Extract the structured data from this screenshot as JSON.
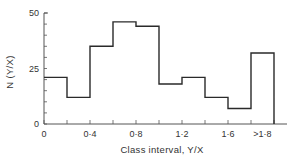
{
  "chart_data": {
    "type": "bar",
    "subtype": "histogram-step",
    "title": "",
    "xlabel": "Class interval, Y/X",
    "ylabel": "N (Y/X)",
    "bin_edges": [
      0,
      0.2,
      0.4,
      0.6,
      0.8,
      1.0,
      1.2,
      1.4,
      1.6,
      1.8,
      2.0
    ],
    "categories": [
      "0-0.2",
      "0.2-0.4",
      "0.4-0.6",
      "0.6-0.8",
      "0.8-1.0",
      "1.0-1.2",
      "1.2-1.4",
      "1.4-1.6",
      "1.6-1.8",
      ">1.8"
    ],
    "values": [
      21,
      12,
      35,
      46,
      44,
      18,
      21,
      12,
      7,
      32
    ],
    "ylim": [
      0,
      50
    ],
    "xlim": [
      0,
      2.1
    ],
    "y_ticks": [
      0,
      25,
      50
    ],
    "y_minor_step": 5,
    "x_ticks": [
      {
        "value": 0,
        "label": "0"
      },
      {
        "value": 0.4,
        "label": "0·4"
      },
      {
        "value": 0.8,
        "label": "0·8"
      },
      {
        "value": 1.2,
        "label": "1·2"
      },
      {
        "value": 1.6,
        "label": "1·6"
      },
      {
        "value": 1.9,
        "label": ">1·8"
      }
    ],
    "x_minor_step": 0.2,
    "grid": false,
    "legend": null
  },
  "style": {
    "line_color": "#2a2a2a",
    "axis_color": "#555555"
  }
}
